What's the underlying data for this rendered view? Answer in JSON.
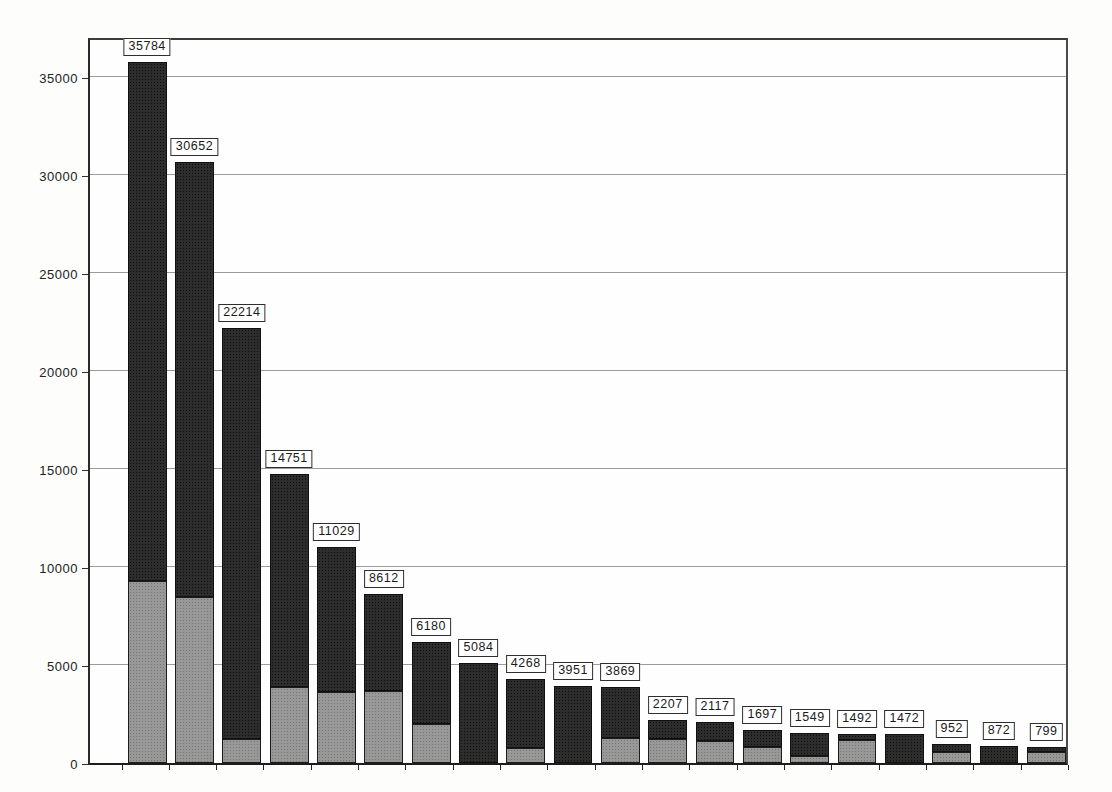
{
  "page": {
    "background_color": "#fdfdfc",
    "description_colors": {
      "upper_segment": "#2d2d2d",
      "lower_segment": "#989898",
      "gridline": "#9b9b9b",
      "plot_border": "#2a2a2a",
      "label_box_border": "#2e2e2e",
      "label_box_fill": "#ffffff"
    }
  },
  "chart_data": {
    "type": "bar",
    "stacked": true,
    "title": "",
    "xlabel": "",
    "ylabel": "",
    "categories": [
      "",
      "",
      "",
      "",
      "",
      "",
      "",
      "",
      "",
      "",
      "",
      "",
      "",
      "",
      "",
      "",
      "",
      "",
      "",
      ""
    ],
    "totals": [
      35784,
      30652,
      22214,
      14751,
      11029,
      8612,
      6180,
      5084,
      4268,
      3951,
      3869,
      2207,
      2117,
      1697,
      1549,
      1492,
      1472,
      952,
      872,
      799
    ],
    "value_labels": [
      "35784",
      "30652",
      "22214",
      "14751",
      "11029",
      "8612",
      "6180",
      "5084",
      "4268",
      "3951",
      "3869",
      "2207",
      "2117",
      "1697",
      "1549",
      "1492",
      "1472",
      "952",
      "872",
      "799"
    ],
    "series": [
      {
        "name": "lower-light-segment",
        "color": "#989898",
        "values": [
          9300,
          8470,
          1220,
          3880,
          3620,
          3690,
          2000,
          0,
          760,
          0,
          1270,
          1230,
          1130,
          820,
          360,
          1180,
          0,
          560,
          0,
          560
        ]
      },
      {
        "name": "upper-dark-segment",
        "color": "#2d2d2d",
        "values": [
          26484,
          22182,
          20994,
          10871,
          7409,
          4922,
          4180,
          5084,
          3508,
          3951,
          2599,
          977,
          987,
          877,
          1189,
          312,
          1472,
          392,
          872,
          239
        ]
      }
    ],
    "yticks": [
      0,
      5000,
      10000,
      15000,
      20000,
      25000,
      30000,
      35000
    ],
    "ytick_labels": [
      "0",
      "5000",
      "10000",
      "15000",
      "20000",
      "25000",
      "30000",
      "35000"
    ],
    "ylim": [
      0,
      37100
    ],
    "grid": "horizontal",
    "legend": "none"
  }
}
